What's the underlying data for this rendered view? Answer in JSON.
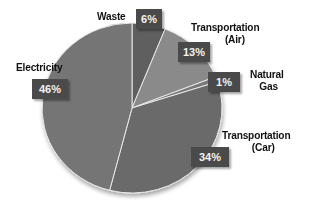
{
  "chart_data": {
    "type": "pie",
    "title": "",
    "categories": [
      "Waste",
      "Transportation (Air)",
      "Natural Gas",
      "Transportation (Car)",
      "Electricity"
    ],
    "values": [
      6,
      13,
      1,
      34,
      46
    ],
    "value_labels": [
      "6%",
      "13%",
      "1%",
      "34%",
      "46%"
    ],
    "start_angle_deg": 0,
    "direction": "clockwise",
    "slice_colors": [
      "#5e5e5e",
      "#8a8a8a",
      "#7a7a7a",
      "#6b6b6b",
      "#747474"
    ],
    "legend": "none (direct labels)"
  },
  "labels": {
    "waste": {
      "name": "Waste",
      "pct": "6%"
    },
    "air": {
      "name_line1": "Transportation",
      "name_line2": "(Air)",
      "pct": "13%"
    },
    "gas": {
      "name_line1": "Natural",
      "name_line2": "Gas",
      "pct": "1%"
    },
    "car": {
      "name_line1": "Transportation",
      "name_line2": "(Car)",
      "pct": "34%"
    },
    "electricity": {
      "name": "Electricity",
      "pct": "46%"
    }
  }
}
